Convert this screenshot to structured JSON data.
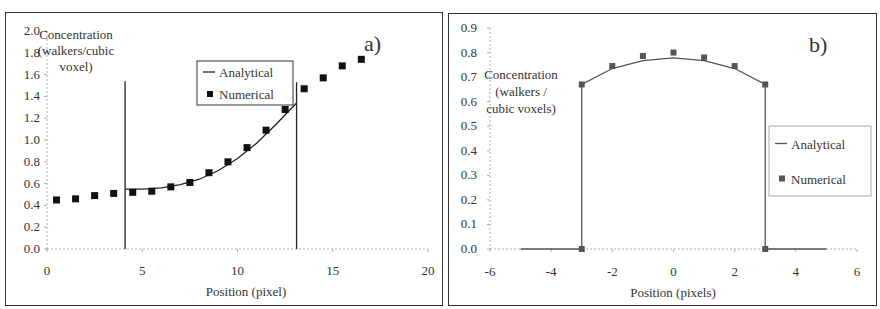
{
  "chart_data": [
    {
      "id": "a",
      "type": "line+scatter",
      "panel_label": "a)",
      "title": "",
      "xlabel": "Position (pixel)",
      "ylabel": "Concentration (walkers/cubic voxel)",
      "ylabel_lines": [
        "Concentration",
        "(walkers/cubic",
        "voxel)"
      ],
      "xlim": [
        0,
        20
      ],
      "ylim": [
        0,
        2.0
      ],
      "xticks": [
        0,
        5,
        10,
        15,
        20
      ],
      "yticks": [
        0.0,
        0.2,
        0.4,
        0.6,
        0.8,
        1.0,
        1.2,
        1.4,
        1.6,
        1.8,
        2.0
      ],
      "ytick_labels": [
        "0.0",
        "0.2",
        "0.4",
        "0.6",
        "0.8",
        "1.0",
        "1.2",
        "1.4",
        "1.6",
        "1.8",
        "2.0"
      ],
      "grid": false,
      "legend": {
        "position": "upper-middle",
        "entries": [
          "Analytical",
          "Numerical"
        ]
      },
      "series": [
        {
          "name": "Analytical",
          "style": "line",
          "x": [
            4.1,
            5.0,
            6.0,
            7.0,
            8.0,
            9.0,
            10.0,
            11.0,
            12.0,
            13.1
          ],
          "y": [
            0.55,
            0.55,
            0.56,
            0.59,
            0.64,
            0.72,
            0.83,
            0.97,
            1.14,
            1.34
          ],
          "boundaries": [
            {
              "x": 4.1,
              "y_top": 1.54
            },
            {
              "x": 13.1,
              "y_top": 1.53
            }
          ]
        },
        {
          "name": "Numerical",
          "style": "marker-square",
          "x": [
            0.5,
            1.5,
            2.5,
            3.5,
            4.5,
            5.5,
            6.5,
            7.5,
            8.5,
            9.5,
            10.5,
            11.5,
            12.5,
            13.5,
            14.5,
            15.5,
            16.5
          ],
          "y": [
            0.45,
            0.46,
            0.49,
            0.51,
            0.52,
            0.53,
            0.57,
            0.61,
            0.7,
            0.8,
            0.93,
            1.09,
            1.28,
            1.47,
            1.57,
            1.68,
            1.74
          ]
        }
      ]
    },
    {
      "id": "b",
      "type": "line+scatter",
      "panel_label": "b)",
      "title": "",
      "xlabel": "Position (pixels)",
      "ylabel": "Concentration (walkers / cubic voxels)",
      "ylabel_lines": [
        "Concentration",
        "(walkers /",
        "cubic voxels)"
      ],
      "xlim": [
        -6,
        6
      ],
      "ylim": [
        0,
        0.9
      ],
      "xticks": [
        -6,
        -4,
        -2,
        0,
        2,
        4,
        6
      ],
      "yticks": [
        0.0,
        0.1,
        0.2,
        0.3,
        0.4,
        0.5,
        0.6,
        0.7,
        0.8,
        0.9
      ],
      "ytick_labels": [
        "0.0",
        "0.1",
        "0.2",
        "0.3",
        "0.4",
        "0.5",
        "0.6",
        "0.7",
        "0.8",
        "0.9"
      ],
      "grid": false,
      "legend": {
        "position": "right",
        "entries": [
          "Analytical",
          "Numerical"
        ]
      },
      "series": [
        {
          "name": "Analytical",
          "style": "line",
          "x": [
            -5,
            -3,
            -3,
            -2,
            -1,
            0,
            1,
            2,
            3,
            3,
            5
          ],
          "y": [
            0.0,
            0.0,
            0.67,
            0.735,
            0.767,
            0.778,
            0.767,
            0.735,
            0.67,
            0.0,
            0.0
          ]
        },
        {
          "name": "Numerical",
          "style": "marker-square",
          "x": [
            -3,
            -3,
            -2,
            -1,
            0,
            1,
            2,
            3,
            3
          ],
          "y": [
            0.0,
            0.67,
            0.745,
            0.786,
            0.8,
            0.78,
            0.745,
            0.67,
            0.0
          ]
        }
      ]
    }
  ],
  "colors": {
    "axis": "#999999",
    "text": "#333333",
    "frame": "#333333",
    "series_a_line": "#222222",
    "series_a_marker": "#111111",
    "series_b_line": "#555555",
    "series_b_marker": "#555555"
  }
}
